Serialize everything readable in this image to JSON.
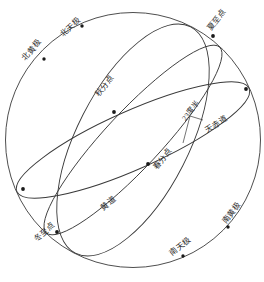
{
  "figure": {
    "kind": "celestial-sphere-diagram",
    "background_color": "#ffffff",
    "stroke_color": "#3a3a3a",
    "text_color": "#2b2b2b"
  },
  "sphere": {
    "center_x": 133,
    "center_y": 140,
    "radius": 128
  },
  "labels": [
    {
      "id": "north-ecliptic-pole",
      "text": "北黄极",
      "x": 20,
      "y": 56,
      "rotate": -48
    },
    {
      "id": "north-celestial-pole",
      "text": "北天极",
      "x": 58,
      "y": 32,
      "rotate": -42
    },
    {
      "id": "summer-solstice-point",
      "text": "夏至点",
      "x": 205,
      "y": 27,
      "rotate": -52
    },
    {
      "id": "autumn-equinox-point",
      "text": "秋分点",
      "x": 93,
      "y": 93,
      "rotate": -52
    },
    {
      "id": "obliquity-angle",
      "text": "23度半",
      "x": 180,
      "y": 117,
      "rotate": -52
    },
    {
      "id": "celestial-equator",
      "text": "天赤道",
      "x": 203,
      "y": 127,
      "rotate": -32
    },
    {
      "id": "spring-equinox-point",
      "text": "春分点",
      "x": 151,
      "y": 166,
      "rotate": -52
    },
    {
      "id": "ecliptic",
      "text": "黄道",
      "x": 99,
      "y": 205,
      "rotate": -38
    },
    {
      "id": "winter-solstice-point",
      "text": "冬至点",
      "x": 32,
      "y": 237,
      "rotate": -42
    },
    {
      "id": "south-celestial-pole",
      "text": "南天极",
      "x": 168,
      "y": 251,
      "rotate": -40
    },
    {
      "id": "south-ecliptic-pole",
      "text": "南黄极",
      "x": 220,
      "y": 220,
      "rotate": -52
    }
  ],
  "markers": [
    {
      "id": "marker-north-ecliptic-pole",
      "x": 44,
      "y": 59
    },
    {
      "id": "marker-north-celestial-pole",
      "x": 82,
      "y": 26
    },
    {
      "id": "marker-summer-solstice",
      "x": 213,
      "y": 36
    },
    {
      "id": "marker-autumn-equinox",
      "x": 114,
      "y": 112
    },
    {
      "id": "marker-equator-right",
      "x": 246,
      "y": 89
    },
    {
      "id": "marker-spring-equinox",
      "x": 148,
      "y": 164
    },
    {
      "id": "marker-equator-left",
      "x": 23,
      "y": 189
    },
    {
      "id": "marker-winter-solstice",
      "x": 57,
      "y": 232
    },
    {
      "id": "marker-south-celestial-pole",
      "x": 183,
      "y": 256
    },
    {
      "id": "marker-south-ecliptic-pole",
      "x": 228,
      "y": 227
    }
  ],
  "curves": {
    "outer_circle": "sphere outline",
    "celestial_equator": "great circle tilted, passes spring and autumn equinox",
    "ecliptic": "great circle tilted 23.5 degrees from equator",
    "solstitial_colure": "great circle through poles and solstice points"
  }
}
